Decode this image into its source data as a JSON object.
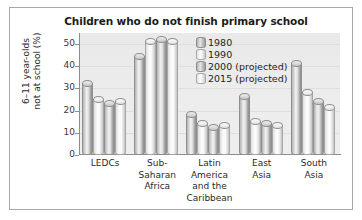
{
  "chart_data": {
    "type": "bar",
    "title": "Children who do not finish primary school",
    "xlabel": "",
    "ylabel": "6–11 year-olds\nnot at school (%)",
    "ylim": [
      0,
      55
    ],
    "yticks": [
      0,
      10,
      20,
      30,
      40,
      50
    ],
    "grid": true,
    "legend_position": "top-right",
    "categories": [
      "LEDCs",
      "Sub-\nSaharan\nAfrica",
      "Latin\nAmerica\nand the\nCaribbean",
      "East\nAsia",
      "South\nAsia"
    ],
    "series": [
      {
        "name": "1980",
        "style": "dark",
        "values": [
          32,
          44,
          18,
          26,
          41
        ]
      },
      {
        "name": "1990",
        "style": "light",
        "values": [
          25,
          51,
          14,
          15,
          28
        ]
      },
      {
        "name": "2000 (projected)",
        "style": "dark",
        "values": [
          23,
          52,
          12,
          14,
          24
        ]
      },
      {
        "name": "2015 (projected)",
        "style": "light",
        "values": [
          24,
          51,
          13,
          13,
          21
        ]
      }
    ]
  },
  "legend": {
    "items": [
      {
        "label": "1980",
        "style": "dark"
      },
      {
        "label": "1990",
        "style": "light"
      },
      {
        "label": "2000 (projected)",
        "style": "dark"
      },
      {
        "label": "2015 (projected)",
        "style": "light"
      }
    ]
  },
  "colors": {
    "frame": "#a8a8a8",
    "plot_background": "#ececec",
    "axis": "#8d8d8d",
    "bar_dark": "#b4b4b4",
    "bar_light": "#f2f2f2",
    "text": "#1e1e1e"
  }
}
